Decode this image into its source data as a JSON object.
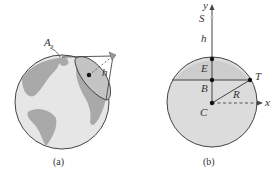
{
  "panel_a": {
    "caption": "(a)",
    "labels": {
      "satellite": "A",
      "satellite_sub": "s",
      "height": "h"
    },
    "colors": {
      "ocean": "#e6e6e6",
      "land": "#a9a9a9",
      "outline": "#444444"
    }
  },
  "panel_b": {
    "caption": "(b)",
    "labels": {
      "y_axis": "y",
      "x_axis": "x",
      "satellite": "S",
      "height": "h",
      "E": "E",
      "B": "B",
      "T": "T",
      "R": "R",
      "C": "C"
    },
    "colors": {
      "disk": "#dcdcdc",
      "cap": "#cfcfcf",
      "outline": "#444444"
    }
  }
}
